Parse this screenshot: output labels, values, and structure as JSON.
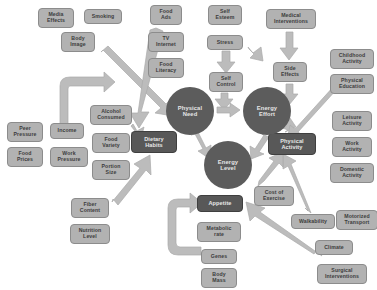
{
  "diagram": {
    "palette": {
      "background": "#ffffff",
      "box_fill": "#b2b2b2",
      "box_stroke": "#8c8c8c",
      "box_text": "#3c3c3c",
      "dark_box_fill": "#585858",
      "dark_box_text": "#e8e8e8",
      "circle_fill": "#5c5c5c",
      "circle_text": "#e6e6e6",
      "arrow_fill": "#b9b9b9",
      "arrow_stroke": "#a6a6a6"
    },
    "nodes": [
      {
        "id": "media-effects",
        "label": "Media\nEffects",
        "shape": "box",
        "x": 38,
        "y": 8,
        "w": 36,
        "h": 20
      },
      {
        "id": "smoking",
        "label": "Smoking",
        "shape": "box",
        "x": 84,
        "y": 9,
        "w": 38,
        "h": 15
      },
      {
        "id": "body-image",
        "label": "Body\nImage",
        "shape": "box",
        "x": 61,
        "y": 32,
        "w": 34,
        "h": 20
      },
      {
        "id": "food-ads",
        "label": "Food\nAds",
        "shape": "box",
        "x": 150,
        "y": 5,
        "w": 32,
        "h": 20
      },
      {
        "id": "tv-internet",
        "label": "TV\nInternet",
        "shape": "box",
        "x": 148,
        "y": 32,
        "w": 36,
        "h": 20
      },
      {
        "id": "food-literacy",
        "label": "Food\nLiteracy",
        "shape": "box",
        "x": 148,
        "y": 58,
        "w": 36,
        "h": 20
      },
      {
        "id": "self-esteem",
        "label": "Self\nEsteem",
        "shape": "box",
        "x": 208,
        "y": 5,
        "w": 34,
        "h": 20
      },
      {
        "id": "stress",
        "label": "Stress",
        "shape": "box",
        "x": 207,
        "y": 35,
        "w": 36,
        "h": 15
      },
      {
        "id": "self-control",
        "label": "Self\nControl",
        "shape": "box",
        "x": 209,
        "y": 72,
        "w": 34,
        "h": 20
      },
      {
        "id": "medical-interventions",
        "label": "Medical\nInterventions",
        "shape": "box",
        "x": 266,
        "y": 9,
        "w": 50,
        "h": 20
      },
      {
        "id": "side-effects",
        "label": "Side\nEffects",
        "shape": "box",
        "x": 273,
        "y": 62,
        "w": 34,
        "h": 20
      },
      {
        "id": "childhood-activity",
        "label": "Childhood\nActivity",
        "shape": "box",
        "x": 330,
        "y": 49,
        "w": 44,
        "h": 20
      },
      {
        "id": "physical-education",
        "label": "Physical\nEducation",
        "shape": "box",
        "x": 330,
        "y": 74,
        "w": 44,
        "h": 20
      },
      {
        "id": "leisure-activity",
        "label": "Leisure\nActivity",
        "shape": "box",
        "x": 332,
        "y": 111,
        "w": 40,
        "h": 20
      },
      {
        "id": "work-activity",
        "label": "Work\nActivity",
        "shape": "box",
        "x": 332,
        "y": 137,
        "w": 40,
        "h": 20
      },
      {
        "id": "domestic-activity",
        "label": "Domestic\nActivity",
        "shape": "box",
        "x": 330,
        "y": 163,
        "w": 44,
        "h": 20
      },
      {
        "id": "peer-pressure",
        "label": "Peer\nPressure",
        "shape": "box",
        "x": 7,
        "y": 122,
        "w": 36,
        "h": 20
      },
      {
        "id": "income",
        "label": "Income",
        "shape": "box",
        "x": 50,
        "y": 123,
        "w": 34,
        "h": 16
      },
      {
        "id": "food-prices",
        "label": "Food\nPrices",
        "shape": "box",
        "x": 7,
        "y": 147,
        "w": 36,
        "h": 20
      },
      {
        "id": "work-pressure",
        "label": "Work\nPressure",
        "shape": "box",
        "x": 50,
        "y": 147,
        "w": 38,
        "h": 20
      },
      {
        "id": "alcohol-consumed",
        "label": "Alcohol\nConsumed",
        "shape": "box",
        "x": 90,
        "y": 105,
        "w": 42,
        "h": 20
      },
      {
        "id": "food-variety",
        "label": "Food\nVariety",
        "shape": "box",
        "x": 92,
        "y": 133,
        "w": 38,
        "h": 20
      },
      {
        "id": "portion-size",
        "label": "Portion\nSize",
        "shape": "box",
        "x": 92,
        "y": 160,
        "w": 38,
        "h": 20
      },
      {
        "id": "fiber-content",
        "label": "Fiber\nContent",
        "shape": "box",
        "x": 71,
        "y": 198,
        "w": 38,
        "h": 20
      },
      {
        "id": "nutrition-level",
        "label": "Nutrition\nLevel",
        "shape": "box",
        "x": 70,
        "y": 224,
        "w": 40,
        "h": 20
      },
      {
        "id": "metabolic-rate",
        "label": "Metabolic\nrate",
        "shape": "box",
        "x": 197,
        "y": 222,
        "w": 44,
        "h": 20
      },
      {
        "id": "genes",
        "label": "Genes",
        "shape": "box",
        "x": 201,
        "y": 249,
        "w": 36,
        "h": 15
      },
      {
        "id": "body-mass",
        "label": "Body\nMass",
        "shape": "box",
        "x": 201,
        "y": 268,
        "w": 36,
        "h": 20
      },
      {
        "id": "cost-of-exercise",
        "label": "Cost of\nExercise",
        "shape": "box",
        "x": 254,
        "y": 186,
        "w": 40,
        "h": 20
      },
      {
        "id": "walkability",
        "label": "Walkability",
        "shape": "box",
        "x": 291,
        "y": 214,
        "w": 44,
        "h": 15
      },
      {
        "id": "motorized-transport",
        "label": "Motorized\nTransport",
        "shape": "box",
        "x": 336,
        "y": 210,
        "w": 42,
        "h": 20
      },
      {
        "id": "climate",
        "label": "Climate",
        "shape": "box",
        "x": 315,
        "y": 240,
        "w": 38,
        "h": 15
      },
      {
        "id": "surgical-interventions",
        "label": "Surgical\nInterventions",
        "shape": "box",
        "x": 317,
        "y": 264,
        "w": 50,
        "h": 20
      },
      {
        "id": "dietary-habits",
        "label": "Dietary\nHabits",
        "shape": "box-dark",
        "x": 131,
        "y": 131,
        "w": 46,
        "h": 22
      },
      {
        "id": "physical-activity",
        "label": "Physical\nActivity",
        "shape": "box-dark",
        "x": 268,
        "y": 133,
        "w": 48,
        "h": 22
      },
      {
        "id": "appetite",
        "label": "Appetite",
        "shape": "box-dark",
        "x": 197,
        "y": 195,
        "w": 46,
        "h": 17
      },
      {
        "id": "physical-need",
        "label": "Physical\nNeed",
        "shape": "circle",
        "x": 166,
        "y": 87,
        "w": 48,
        "h": 48
      },
      {
        "id": "energy-effort",
        "label": "Energy\nEffort",
        "shape": "circle",
        "x": 243,
        "y": 87,
        "w": 48,
        "h": 48
      },
      {
        "id": "energy-level",
        "label": "Energy\nLevel",
        "shape": "circle",
        "x": 204,
        "y": 141,
        "w": 48,
        "h": 48
      }
    ],
    "edges": [
      {
        "id": "body-image-to-physical-need",
        "from": "body-image",
        "to": "physical-need",
        "style": "straight"
      },
      {
        "id": "food-ads-to-dietary-habits",
        "from": "food-ads",
        "to": "dietary-habits",
        "style": "straight"
      },
      {
        "id": "stress-to-self-control",
        "from": "stress",
        "to": "self-control",
        "style": "straight"
      },
      {
        "id": "self-control-to-physical-need",
        "from": "self-control",
        "to": "physical-need",
        "style": "straight"
      },
      {
        "id": "stress-to-medical-interventions",
        "from": "stress",
        "to": "medical-interventions",
        "style": "straight"
      },
      {
        "id": "medical-to-side-effects",
        "from": "medical-interventions",
        "to": "side-effects",
        "style": "straight"
      },
      {
        "id": "side-effects-to-energy-effort",
        "from": "side-effects",
        "to": "energy-effort",
        "style": "straight"
      },
      {
        "id": "income-to-alcohol-consumed",
        "from": "income",
        "to": "alcohol-consumed",
        "style": "curved"
      },
      {
        "id": "alcohol-to-dietary-habits",
        "from": "alcohol-consumed",
        "to": "dietary-habits",
        "style": "straight"
      },
      {
        "id": "fiber-to-dietary-habits",
        "from": "fiber-content",
        "to": "dietary-habits",
        "style": "straight"
      },
      {
        "id": "physical-need-to-energy-effort",
        "from": "physical-need",
        "to": "energy-effort",
        "style": "straight"
      },
      {
        "id": "physical-need-to-energy-level",
        "from": "physical-need",
        "to": "energy-level",
        "style": "straight"
      },
      {
        "id": "energy-effort-to-energy-level",
        "from": "energy-effort",
        "to": "energy-level",
        "style": "straight"
      },
      {
        "id": "energy-effort-to-physical-activity",
        "from": "energy-effort",
        "to": "physical-activity",
        "style": "straight"
      },
      {
        "id": "childhood-to-physical-activity",
        "from": "childhood-activity",
        "to": "physical-activity",
        "style": "straight"
      },
      {
        "id": "walkability-to-physical-activity",
        "from": "walkability",
        "to": "physical-activity",
        "style": "straight"
      },
      {
        "id": "cost-of-exercise-to-physical-activity",
        "from": "cost-of-exercise",
        "to": "physical-activity",
        "style": "straight"
      },
      {
        "id": "climate-to-cost-of-exercise",
        "from": "climate",
        "to": "cost-of-exercise",
        "style": "straight"
      },
      {
        "id": "genes-to-appetite",
        "from": "genes",
        "to": "appetite",
        "style": "curved"
      }
    ]
  }
}
